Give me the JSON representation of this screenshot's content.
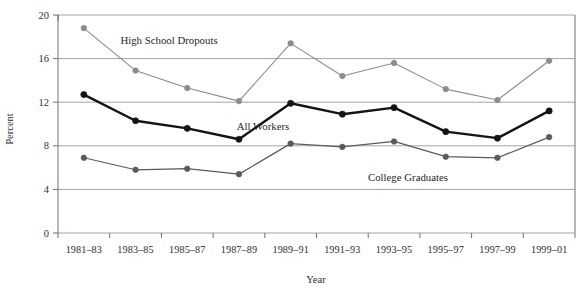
{
  "chart_data": {
    "type": "line",
    "title": "",
    "xlabel": "Year",
    "ylabel": "Percent",
    "ylim": [
      0,
      20
    ],
    "yticks": [
      0,
      4,
      8,
      12,
      16,
      20
    ],
    "grid": true,
    "legend_position": "inline-annotations",
    "categories": [
      "1981–83",
      "1983–85",
      "1985–87",
      "1987–89",
      "1989–91",
      "1991–93",
      "1993–95",
      "1995–97",
      "1997–99",
      "1999–01"
    ],
    "series": [
      {
        "name": "High School Dropouts",
        "color": "#8c8c8c",
        "line_width": 1.1,
        "values": [
          18.8,
          14.9,
          13.3,
          12.1,
          17.4,
          14.4,
          15.6,
          13.2,
          12.2,
          15.8
        ]
      },
      {
        "name": "All Workers",
        "color": "#141414",
        "line_width": 2.4,
        "values": [
          12.7,
          10.3,
          9.6,
          8.6,
          11.9,
          10.9,
          11.5,
          9.3,
          8.7,
          11.2
        ]
      },
      {
        "name": "College Graduates",
        "color": "#5a5a5a",
        "line_width": 1.2,
        "values": [
          6.9,
          5.8,
          5.9,
          5.4,
          8.2,
          7.9,
          8.4,
          7.0,
          6.9,
          8.8
        ]
      }
    ],
    "annotations": [
      {
        "text": "High School Dropouts",
        "x_px": 169,
        "y_px": 44
      },
      {
        "text": "All Workers",
        "x_px": 263,
        "y_px": 130
      },
      {
        "text": "College Graduates",
        "x_px": 408,
        "y_px": 181
      }
    ]
  },
  "axis": {
    "y_tick_labels": [
      "20",
      "16",
      "12",
      "8",
      "4",
      "0"
    ],
    "y_title": "Percent",
    "x_title": "Year"
  }
}
